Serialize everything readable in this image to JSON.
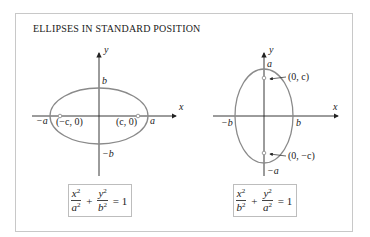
{
  "title": "ELLIPSES IN STANDARD POSITION",
  "colors": {
    "frame": "#c8c8c8",
    "curve": "#8a8a8a",
    "axis": "#222222",
    "focus": "#9a9a9a"
  },
  "diagrams": [
    {
      "orientation": "horizontal major axis",
      "axis_labels": {
        "x": "x",
        "y": "y"
      },
      "vertex_labels": {
        "top": "b",
        "bottom": "−b",
        "left": "−a",
        "right": "a"
      },
      "focus_labels": {
        "left": "(−c, 0)",
        "right": "(c, 0)"
      },
      "formula": {
        "term1": {
          "num": "x",
          "num_exp": "2",
          "den": "a",
          "den_exp": "2"
        },
        "op": "+",
        "term2": {
          "num": "y",
          "num_exp": "2",
          "den": "b",
          "den_exp": "2"
        },
        "equals": "= 1"
      }
    },
    {
      "orientation": "vertical major axis",
      "axis_labels": {
        "x": "x",
        "y": "y"
      },
      "vertex_labels": {
        "top": "a",
        "bottom": "−a",
        "left": "−b",
        "right": "b"
      },
      "focus_labels": {
        "top": "(0, c)",
        "bottom": "(0, −c)"
      },
      "formula": {
        "term1": {
          "num": "x",
          "num_exp": "2",
          "den": "b",
          "den_exp": "2"
        },
        "op": "+",
        "term2": {
          "num": "y",
          "num_exp": "2",
          "den": "a",
          "den_exp": "2"
        },
        "equals": "= 1"
      }
    }
  ]
}
